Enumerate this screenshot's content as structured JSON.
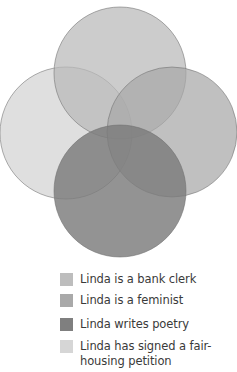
{
  "diagram": {
    "type": "venn",
    "sets": [
      {
        "id": "bank-clerk",
        "label": "Linda is a bank clerk",
        "color": "#b9b9b9",
        "position": "top",
        "cx": 120,
        "cy": 73,
        "r": 66
      },
      {
        "id": "feminist",
        "label": "Linda is a feminist",
        "color": "#a8a8a8",
        "position": "right",
        "cx": 172,
        "cy": 132,
        "r": 65
      },
      {
        "id": "poetry",
        "label": "Linda writes poetry",
        "color": "#7b7b7b",
        "position": "bottom",
        "cx": 120,
        "cy": 191,
        "r": 66
      },
      {
        "id": "petition",
        "label": "Linda has signed a fair-housing petition",
        "color": "#d3d3d3",
        "position": "left",
        "cx": 66,
        "cy": 133,
        "r": 66
      }
    ]
  },
  "legend": {
    "items": [
      {
        "label": "Linda is a bank clerk",
        "color": "#bdbdbd"
      },
      {
        "label": "Linda is a feminist",
        "color": "#a9a9a9"
      },
      {
        "label": "Linda writes poetry",
        "color": "#7f7f7f"
      },
      {
        "label": "Linda has signed a fair-housing petition",
        "color": "#d6d6d6"
      }
    ]
  }
}
